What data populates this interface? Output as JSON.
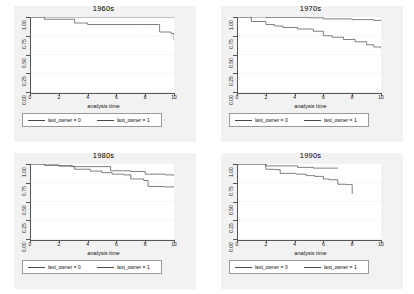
{
  "figure": {
    "layout": "2x2 panel grid",
    "background_color": "#ffffff",
    "panel_background_color": "#f2f2f2",
    "plot_background_color": "#ffffff",
    "line_color": "#4a4a4a"
  },
  "legend": {
    "entry_0": "last_owner = 0",
    "entry_1": "last_owner = 1"
  },
  "axis": {
    "xlabel": "analysis time",
    "xticks": [
      "0",
      "2",
      "4",
      "6",
      "8",
      "10"
    ],
    "yticks": [
      "0.00",
      "0.25",
      "0.50",
      "0.75",
      "1.00"
    ]
  },
  "chart_data": [
    {
      "type": "line",
      "title": "1960s",
      "xlabel": "analysis time",
      "ylabel": "",
      "xlim": [
        0,
        10
      ],
      "ylim": [
        0,
        1
      ],
      "xticks": [
        0,
        2,
        4,
        6,
        8,
        10
      ],
      "yticks": [
        0.0,
        0.25,
        0.5,
        0.75,
        1.0
      ],
      "grid": true,
      "legend_position": "below-plot",
      "step": true,
      "series": [
        {
          "name": "last_owner = 0",
          "x": [
            0,
            10
          ],
          "values": [
            1.0,
            1.0
          ]
        },
        {
          "name": "last_owner = 1",
          "x": [
            0,
            1.0,
            3.1,
            4.0,
            7.9,
            9.0,
            9.8,
            10.0
          ],
          "values": [
            1.0,
            0.97,
            0.92,
            0.9,
            0.9,
            0.8,
            0.78,
            0.69
          ]
        }
      ]
    },
    {
      "type": "line",
      "title": "1970s",
      "xlabel": "analysis time",
      "ylabel": "",
      "xlim": [
        0,
        10
      ],
      "ylim": [
        0,
        1
      ],
      "xticks": [
        0,
        2,
        4,
        6,
        8,
        10
      ],
      "yticks": [
        0.0,
        0.25,
        0.5,
        0.75,
        1.0
      ],
      "grid": true,
      "legend_position": "below-plot",
      "step": true,
      "series": [
        {
          "name": "last_owner = 0",
          "x": [
            0,
            1.0,
            2.0,
            5.0,
            6.0,
            8.0,
            9.5,
            10.0
          ],
          "values": [
            1.0,
            1.0,
            0.995,
            0.99,
            0.975,
            0.965,
            0.955,
            0.95
          ]
        },
        {
          "name": "last_owner = 1",
          "x": [
            0,
            1.0,
            2.0,
            2.6,
            3.2,
            4.2,
            5.3,
            6.0,
            6.6,
            7.4,
            8.2,
            9.0,
            9.5,
            10.0
          ],
          "values": [
            1.0,
            0.94,
            0.9,
            0.88,
            0.86,
            0.84,
            0.81,
            0.75,
            0.73,
            0.7,
            0.67,
            0.63,
            0.6,
            0.58
          ]
        }
      ]
    },
    {
      "type": "line",
      "title": "1980s",
      "xlabel": "analysis time",
      "ylabel": "",
      "xlim": [
        0,
        10
      ],
      "ylim": [
        0,
        1
      ],
      "xticks": [
        0,
        2,
        4,
        6,
        8,
        10
      ],
      "yticks": [
        0.0,
        0.25,
        0.5,
        0.75,
        1.0
      ],
      "grid": true,
      "legend_position": "below-plot",
      "step": true,
      "series": [
        {
          "name": "last_owner = 0",
          "x": [
            0,
            1.0,
            2.0,
            3.0,
            5.0,
            5.6,
            7.0,
            8.0,
            9.4,
            10.0
          ],
          "values": [
            1.0,
            0.985,
            0.975,
            0.965,
            0.965,
            0.91,
            0.9,
            0.865,
            0.855,
            0.845
          ]
        },
        {
          "name": "last_owner = 1",
          "x": [
            0,
            1.0,
            2.0,
            2.9,
            3.1,
            4.2,
            5.0,
            5.7,
            6.5,
            7.0,
            7.9,
            8.2,
            9.3,
            10.0
          ],
          "values": [
            1.0,
            0.985,
            0.975,
            0.965,
            0.93,
            0.905,
            0.885,
            0.865,
            0.855,
            0.8,
            0.78,
            0.7,
            0.695,
            0.69
          ]
        }
      ]
    },
    {
      "type": "line",
      "title": "1990s",
      "xlabel": "analysis time",
      "ylabel": "",
      "xlim": [
        0,
        10
      ],
      "ylim": [
        0,
        1
      ],
      "xticks": [
        0,
        2,
        4,
        6,
        8,
        10
      ],
      "yticks": [
        0.0,
        0.25,
        0.5,
        0.75,
        1.0
      ],
      "grid": true,
      "legend_position": "below-plot",
      "step": true,
      "series": [
        {
          "name": "last_owner = 0",
          "x": [
            0,
            1.2,
            2.0,
            3.9,
            4.2,
            5.3,
            7.0
          ],
          "values": [
            1.0,
            1.0,
            0.975,
            0.975,
            0.955,
            0.945,
            0.945
          ]
        },
        {
          "name": "last_owner = 1",
          "x": [
            0,
            1.2,
            2.0,
            2.6,
            3.0,
            4.1,
            4.8,
            5.4,
            6.0,
            6.4,
            7.0,
            7.6,
            8.0
          ],
          "values": [
            1.0,
            1.0,
            0.93,
            0.925,
            0.875,
            0.865,
            0.845,
            0.835,
            0.8,
            0.79,
            0.73,
            0.725,
            0.6
          ]
        }
      ]
    }
  ]
}
